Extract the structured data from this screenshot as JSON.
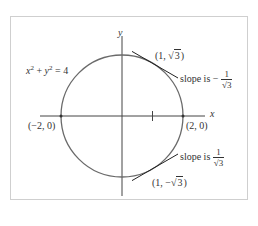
{
  "figure": {
    "equation": {
      "lhs_x": "x",
      "lhs_exp1": "2",
      "plus": " + ",
      "lhs_y": "y",
      "lhs_exp2": "2",
      "rhs": " = 4"
    },
    "axes": {
      "x_label": "x",
      "y_label": "y"
    },
    "points": {
      "left": "(−2, 0)",
      "right": "(2, 0)",
      "upper": {
        "open": "(1, ",
        "radicand": "3",
        "close": ")"
      },
      "lower": {
        "open": "(1, −",
        "radicand": "3",
        "close": ")"
      }
    },
    "slopes": {
      "upper": {
        "prefix": "slope is ",
        "sign": "−",
        "numerator": "1",
        "radicand": "3"
      },
      "lower": {
        "prefix": "slope is ",
        "numerator": "1",
        "radicand": "3"
      }
    },
    "colors": {
      "circle": "#6a6a6a",
      "axis": "#444444",
      "tangent": "#222222",
      "frame": "#cfcfcf"
    }
  }
}
